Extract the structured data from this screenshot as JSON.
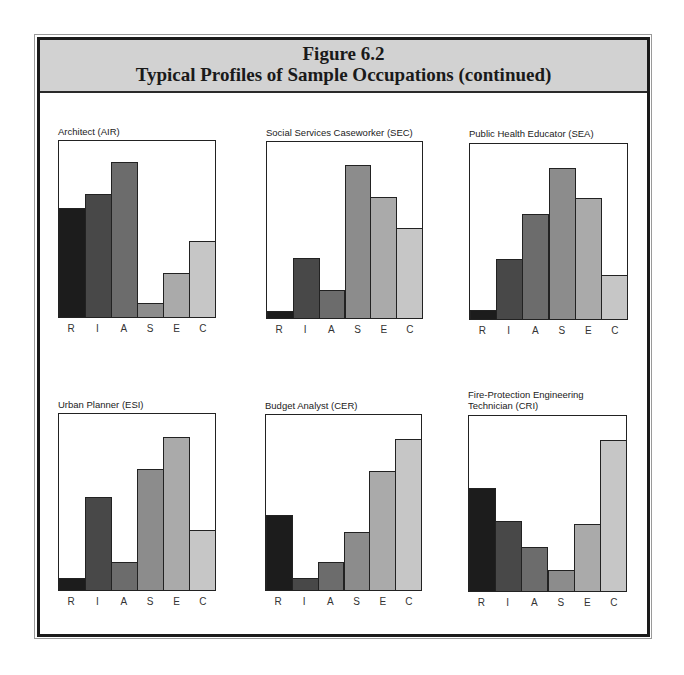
{
  "figure": {
    "number": "Figure 6.2",
    "title": "Typical Profiles of Sample Occupations (continued)"
  },
  "colors": {
    "R": "#1c1c1c",
    "I": "#484848",
    "A": "#6c6c6c",
    "S": "#8c8c8c",
    "E": "#aaaaaa",
    "C": "#c6c6c6",
    "header_bg": "#d2d2d2"
  },
  "chart_data": [
    {
      "type": "bar",
      "title": "Architect (AIR)",
      "categories": [
        "R",
        "I",
        "A",
        "S",
        "E",
        "C"
      ],
      "values": [
        62,
        70,
        88,
        8,
        25,
        43
      ],
      "xlabel": "",
      "ylabel": "",
      "ylim": [
        0,
        100
      ],
      "grid": false,
      "legend": false
    },
    {
      "type": "bar",
      "title": "Social Services Caseworker (SEC)",
      "categories": [
        "R",
        "I",
        "A",
        "S",
        "E",
        "C"
      ],
      "values": [
        4,
        34,
        16,
        87,
        69,
        51
      ],
      "xlabel": "",
      "ylabel": "",
      "ylim": [
        0,
        100
      ],
      "grid": false,
      "legend": false
    },
    {
      "type": "bar",
      "title": "Public Health Educator (SEA)",
      "categories": [
        "R",
        "I",
        "A",
        "S",
        "E",
        "C"
      ],
      "values": [
        5,
        34,
        60,
        86,
        69,
        25
      ],
      "xlabel": "",
      "ylabel": "",
      "ylim": [
        0,
        100
      ],
      "grid": false,
      "legend": false
    },
    {
      "type": "bar",
      "title": "Urban Planner (ESI)",
      "categories": [
        "R",
        "I",
        "A",
        "S",
        "E",
        "C"
      ],
      "values": [
        7,
        53,
        16,
        69,
        87,
        34
      ],
      "xlabel": "",
      "ylabel": "",
      "ylim": [
        0,
        100
      ],
      "grid": false,
      "legend": false
    },
    {
      "type": "bar",
      "title": "Budget Analyst (CER)",
      "categories": [
        "R",
        "I",
        "A",
        "S",
        "E",
        "C"
      ],
      "values": [
        43,
        7,
        16,
        33,
        68,
        86
      ],
      "xlabel": "",
      "ylabel": "",
      "ylim": [
        0,
        100
      ],
      "grid": false,
      "legend": false
    },
    {
      "type": "bar",
      "title": "Fire-Protection Engineering\nTechnician (CRI)",
      "categories": [
        "R",
        "I",
        "A",
        "S",
        "E",
        "C"
      ],
      "values": [
        59,
        40,
        25,
        12,
        38,
        86
      ],
      "xlabel": "",
      "ylabel": "",
      "ylim": [
        0,
        100
      ],
      "grid": false,
      "legend": false
    }
  ]
}
